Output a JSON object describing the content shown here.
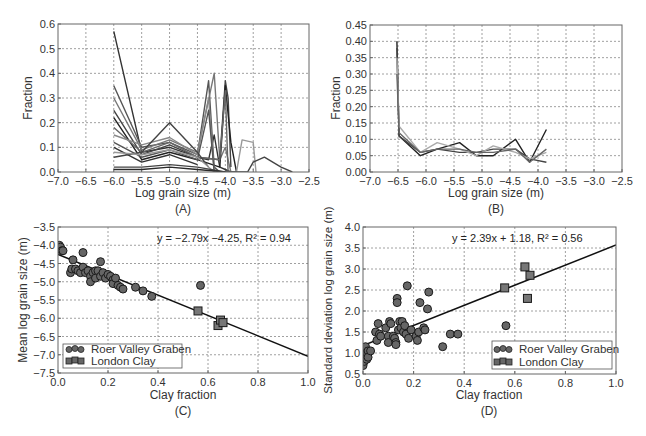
{
  "chart_data": [
    {
      "id": "A",
      "type": "line",
      "panel_label": "(A)",
      "title": "",
      "xlabel": "Log grain size (m)",
      "ylabel": "Fraction",
      "xlim": [
        -7.0,
        -2.5
      ],
      "ylim": [
        0.0,
        0.6
      ],
      "xticks": [
        "-7.0",
        "-6.5",
        "-6.0",
        "-5.5",
        "-5.0",
        "-4.5",
        "-4.0",
        "-3.5",
        "-3.0",
        "-2.5"
      ],
      "yticks": [
        "0.0",
        "0.1",
        "0.2",
        "0.3",
        "0.4",
        "0.5",
        "0.6"
      ],
      "grid": true,
      "note": "Many overlapping grain-size distribution curves (grey shades); representative series below",
      "series": [
        {
          "name": "s1",
          "color": "#333333",
          "x": [
            -6.0,
            -5.5,
            -5.0,
            -4.5,
            -4.3,
            -4.2,
            -4.1,
            -4.0,
            -3.9
          ],
          "y": [
            0.57,
            0.08,
            0.1,
            0.06,
            0.05,
            0.15,
            0.02,
            0.01,
            0.0
          ]
        },
        {
          "name": "s2",
          "color": "#555555",
          "x": [
            -6.0,
            -5.5,
            -5.0,
            -4.5,
            -4.3,
            -4.2,
            -4.1
          ],
          "y": [
            0.35,
            0.1,
            0.12,
            0.07,
            0.37,
            0.02,
            0.0
          ]
        },
        {
          "name": "s3",
          "color": "#777777",
          "x": [
            -6.0,
            -5.5,
            -5.0,
            -4.5,
            -4.2,
            -4.1,
            -4.0,
            -3.9
          ],
          "y": [
            0.3,
            0.09,
            0.13,
            0.08,
            0.4,
            0.05,
            0.1,
            0.0
          ]
        },
        {
          "name": "s4",
          "color": "#444444",
          "x": [
            -6.0,
            -5.5,
            -5.0,
            -4.5,
            -4.1,
            -4.0,
            -3.95,
            -3.9
          ],
          "y": [
            0.25,
            0.07,
            0.11,
            0.06,
            0.05,
            0.37,
            0.3,
            0.02
          ]
        },
        {
          "name": "s5",
          "color": "#222222",
          "x": [
            -6.0,
            -5.5,
            -5.0,
            -4.5,
            -4.1,
            -4.0,
            -3.9,
            -3.8
          ],
          "y": [
            0.22,
            0.05,
            0.08,
            0.05,
            0.02,
            0.35,
            0.12,
            0.0
          ]
        },
        {
          "name": "s6",
          "color": "#666666",
          "x": [
            -6.0,
            -5.5,
            -5.0,
            -4.5,
            -4.1,
            -4.0,
            -3.95
          ],
          "y": [
            0.18,
            0.08,
            0.12,
            0.06,
            0.05,
            0.33,
            0.0
          ]
        },
        {
          "name": "s7",
          "color": "#888888",
          "x": [
            -6.0,
            -5.5,
            -5.0,
            -4.5,
            -4.3,
            -4.2
          ],
          "y": [
            0.15,
            0.11,
            0.14,
            0.07,
            0.3,
            0.0
          ]
        },
        {
          "name": "s8",
          "color": "#555555",
          "x": [
            -6.0,
            -5.5,
            -5.0,
            -4.5,
            -4.3,
            -4.2
          ],
          "y": [
            0.12,
            0.06,
            0.09,
            0.05,
            0.25,
            0.0
          ]
        },
        {
          "name": "s9",
          "color": "#333333",
          "x": [
            -6.0,
            -5.5,
            -5.0,
            -4.5
          ],
          "y": [
            0.1,
            0.04,
            0.07,
            0.03
          ]
        },
        {
          "name": "s10",
          "color": "#444444",
          "x": [
            -6.0,
            -5.5,
            -5.0,
            -4.5,
            -4.3
          ],
          "y": [
            0.06,
            0.08,
            0.2,
            0.08,
            0.02
          ]
        },
        {
          "name": "s11",
          "color": "#999999",
          "x": [
            -6.0,
            -5.5,
            -5.0,
            -4.5,
            -4.2,
            -4.0,
            -3.8,
            -3.7,
            -3.5,
            -3.45
          ],
          "y": [
            0.08,
            0.07,
            0.09,
            0.06,
            0.0,
            0.0,
            0.0,
            0.13,
            0.12,
            0.0
          ]
        },
        {
          "name": "s12",
          "color": "#444444",
          "x": [
            -6.0,
            -5.5,
            -5.0,
            -4.5,
            -4.0,
            -3.6,
            -3.5,
            -3.3,
            -3.0,
            -2.8
          ],
          "y": [
            0.02,
            0.02,
            0.03,
            0.02,
            0.0,
            0.0,
            0.04,
            0.06,
            0.02,
            0.0
          ]
        },
        {
          "name": "s13",
          "color": "#2a2a2a",
          "x": [
            -6.0,
            -5.5,
            -5.0,
            -4.5,
            -4.0
          ],
          "y": [
            0.01,
            0.01,
            0.02,
            0.01,
            0.0
          ]
        }
      ],
      "frame": {
        "left": 58,
        "top": 24,
        "right": 309,
        "bottom": 172
      }
    },
    {
      "id": "B",
      "type": "line",
      "panel_label": "(B)",
      "title": "",
      "xlabel": "Log grain size (m)",
      "ylabel": "Fraction",
      "xlim": [
        -7.0,
        -2.5
      ],
      "ylim": [
        0.0,
        0.45
      ],
      "xticks": [
        "-7.0",
        "-6.5",
        "-6.0",
        "-5.5",
        "-5.0",
        "-4.5",
        "-4.0",
        "-3.5",
        "-3.0",
        "-2.5"
      ],
      "yticks": [
        "0.00",
        "0.05",
        "0.10",
        "0.15",
        "0.20",
        "0.25",
        "0.30",
        "0.35",
        "0.40",
        "0.45"
      ],
      "grid": true,
      "series": [
        {
          "name": "s1",
          "color": "#222222",
          "x": [
            -6.52,
            -6.48,
            -6.1,
            -5.8,
            -5.4,
            -5.1,
            -4.8,
            -4.4,
            -4.15,
            -3.85
          ],
          "y": [
            0.4,
            0.11,
            0.05,
            0.07,
            0.09,
            0.05,
            0.05,
            0.1,
            0.03,
            0.13
          ]
        },
        {
          "name": "s2",
          "color": "#444444",
          "x": [
            -6.52,
            -6.48,
            -6.1,
            -5.8,
            -5.4,
            -5.1,
            -4.8,
            -4.4,
            -4.15,
            -3.85
          ],
          "y": [
            0.38,
            0.11,
            0.06,
            0.07,
            0.06,
            0.06,
            0.07,
            0.07,
            0.04,
            0.03
          ]
        },
        {
          "name": "s3",
          "color": "#aaaaaa",
          "x": [
            -6.52,
            -6.48,
            -6.1,
            -5.8,
            -5.4,
            -5.1,
            -4.8,
            -4.4,
            -4.15,
            -3.85
          ],
          "y": [
            0.35,
            0.14,
            0.06,
            0.09,
            0.07,
            0.05,
            0.08,
            0.06,
            0.04,
            0.06
          ]
        },
        {
          "name": "s4",
          "color": "#666666",
          "x": [
            -6.52,
            -6.48,
            -6.1,
            -5.8,
            -5.4,
            -5.1,
            -4.8,
            -4.4,
            -4.15,
            -3.85
          ],
          "y": [
            0.3,
            0.12,
            0.06,
            0.07,
            0.07,
            0.06,
            0.06,
            0.07,
            0.03,
            0.07
          ]
        }
      ],
      "frame": {
        "left": 370,
        "top": 25,
        "right": 622,
        "bottom": 172
      }
    },
    {
      "id": "C",
      "type": "scatter",
      "panel_label": "(C)",
      "title": "",
      "xlabel": "Clay fraction",
      "ylabel": "Mean log grain size (m)",
      "xlim": [
        0.0,
        1.0
      ],
      "ylim": [
        -7.5,
        -3.5
      ],
      "xticks": [
        "0.0",
        "0.2",
        "0.4",
        "0.6",
        "0.8",
        "1.0"
      ],
      "yticks": [
        "-7.5",
        "-7.0",
        "-6.5",
        "-6.0",
        "-5.5",
        "-5.0",
        "-4.5",
        "-4.0",
        "-3.5"
      ],
      "grid": true,
      "annotation": "y = −2.79x −4.25, R² = 0.94",
      "fit": {
        "slope": -2.79,
        "intercept": -4.25,
        "r2": 0.94
      },
      "legend": {
        "position": "lower left",
        "entries": [
          "Roer Valley Graben",
          "London Clay"
        ]
      },
      "series": [
        {
          "name": "Roer Valley Graben",
          "marker": "circle",
          "color": "#555555",
          "x": [
            0.0,
            0.005,
            0.01,
            0.01,
            0.015,
            0.02,
            0.05,
            0.055,
            0.06,
            0.07,
            0.08,
            0.09,
            0.1,
            0.1,
            0.11,
            0.12,
            0.13,
            0.13,
            0.14,
            0.15,
            0.15,
            0.16,
            0.17,
            0.17,
            0.18,
            0.19,
            0.2,
            0.21,
            0.22,
            0.22,
            0.23,
            0.24,
            0.25,
            0.26,
            0.31,
            0.34,
            0.375,
            0.57
          ],
          "y": [
            -4.05,
            -4.0,
            -4.1,
            -4.05,
            -4.15,
            -4.15,
            -4.75,
            -4.65,
            -4.4,
            -4.65,
            -4.7,
            -4.75,
            -4.6,
            -4.2,
            -4.75,
            -4.7,
            -4.85,
            -5.0,
            -4.75,
            -4.7,
            -4.9,
            -4.7,
            -4.85,
            -4.45,
            -4.75,
            -4.9,
            -4.8,
            -4.85,
            -4.95,
            -5.05,
            -4.9,
            -5.1,
            -5.15,
            -5.2,
            -5.15,
            -5.25,
            -5.4,
            -5.1
          ]
        },
        {
          "name": "London Clay",
          "marker": "square",
          "color": "#555555",
          "x": [
            0.56,
            0.64,
            0.65,
            0.66
          ],
          "y": [
            -5.8,
            -6.2,
            -6.05,
            -6.12
          ]
        }
      ],
      "frame": {
        "left": 58,
        "top": 227,
        "right": 308,
        "bottom": 373
      }
    },
    {
      "id": "D",
      "type": "scatter",
      "panel_label": "(D)",
      "title": "",
      "xlabel": "Clay fraction",
      "ylabel": "Standard deviation log grain size (m)",
      "xlim": [
        0.0,
        1.0
      ],
      "ylim": [
        0.5,
        4.0
      ],
      "xticks": [
        "0.0",
        "0.2",
        "0.4",
        "0.6",
        "0.8",
        "1.0"
      ],
      "yticks": [
        "0.5",
        "1.0",
        "1.5",
        "2.0",
        "2.5",
        "3.0",
        "3.5",
        "4.0"
      ],
      "grid": true,
      "annotation": "y = 2.39x + 1.18, R² = 0.56",
      "fit": {
        "slope": 2.39,
        "intercept": 1.18,
        "r2": 0.56
      },
      "legend": {
        "position": "lower right",
        "entries": [
          "Roer Valley Graben",
          "London Clay"
        ]
      },
      "series": [
        {
          "name": "Roer Valley Graben",
          "marker": "circle",
          "color": "#555555",
          "x": [
            0.0,
            0.005,
            0.005,
            0.01,
            0.01,
            0.015,
            0.015,
            0.02,
            0.02,
            0.03,
            0.05,
            0.055,
            0.06,
            0.065,
            0.07,
            0.09,
            0.1,
            0.1,
            0.105,
            0.11,
            0.12,
            0.125,
            0.13,
            0.13,
            0.135,
            0.135,
            0.14,
            0.145,
            0.15,
            0.155,
            0.16,
            0.165,
            0.17,
            0.175,
            0.18,
            0.19,
            0.21,
            0.215,
            0.22,
            0.225,
            0.24,
            0.245,
            0.255,
            0.26,
            0.315,
            0.345,
            0.375,
            0.565
          ],
          "y": [
            0.7,
            0.8,
            1.1,
            0.95,
            1.15,
            0.85,
            1.0,
            1.05,
            0.9,
            1.05,
            1.5,
            1.3,
            1.7,
            1.45,
            1.4,
            1.6,
            1.4,
            1.25,
            1.75,
            1.7,
            1.4,
            1.35,
            1.25,
            1.2,
            2.3,
            2.2,
            1.55,
            1.75,
            1.6,
            1.75,
            1.5,
            1.65,
            1.45,
            2.6,
            1.35,
            1.55,
            1.4,
            1.3,
            1.5,
            2.2,
            1.6,
            1.55,
            2.05,
            2.45,
            1.15,
            1.45,
            1.45,
            1.65
          ]
        },
        {
          "name": "London Clay",
          "marker": "square",
          "color": "#555555",
          "x": [
            0.56,
            0.64,
            0.65,
            0.66
          ],
          "y": [
            2.55,
            3.05,
            2.3,
            2.85
          ]
        }
      ],
      "frame": {
        "left": 363,
        "top": 227,
        "right": 616,
        "bottom": 374
      }
    }
  ],
  "panels": {
    "A": {
      "label": "(A)",
      "xlabel": "Log grain size (m)",
      "ylabel": "Fraction"
    },
    "B": {
      "label": "(B)",
      "xlabel": "Log grain size (m)",
      "ylabel": "Fraction"
    },
    "C": {
      "label": "(C)",
      "xlabel": "Clay fraction",
      "ylabel": "Mean log grain size (m)",
      "equation": "y = −2.79x −4.25, R² = 0.94",
      "legend": [
        "Roer Valley Graben",
        "London Clay"
      ]
    },
    "D": {
      "label": "(D)",
      "xlabel": "Clay fraction",
      "ylabel": "Standard deviation log grain size (m)",
      "equation": "y = 2.39x + 1.18, R² = 0.56",
      "legend": [
        "Roer Valley Graben",
        "London Clay"
      ]
    }
  }
}
